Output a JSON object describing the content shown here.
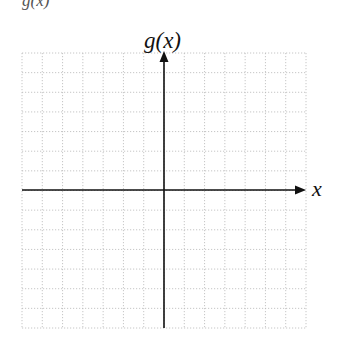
{
  "top_fragment": "g(x)",
  "axes": {
    "x_label": "x",
    "y_label": "g(x)",
    "axis_color": "#111111",
    "grid_color": "#b8b8b8"
  },
  "grid": {
    "columns": 14,
    "rows": 14,
    "left": 22,
    "top": 53,
    "right": 306,
    "bottom": 328,
    "line_style": "dotted"
  },
  "origin": {
    "x": 164,
    "y": 190
  }
}
